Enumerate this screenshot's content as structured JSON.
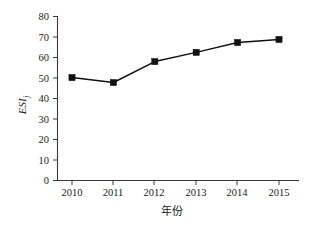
{
  "chart_data": {
    "type": "line",
    "title": "",
    "xlabel": "年份",
    "ylabel": "ESI",
    "ylabel_subscript": "j",
    "categories": [
      "2010",
      "2011",
      "2012",
      "2013",
      "2014",
      "2015"
    ],
    "x": [
      2010,
      2011,
      2012,
      2013,
      2014,
      2015
    ],
    "values": [
      50.2,
      47.8,
      58.0,
      62.5,
      67.3,
      68.8
    ],
    "series": [
      {
        "name": "ESIj",
        "values": [
          50.2,
          47.8,
          58.0,
          62.5,
          67.3,
          68.8
        ],
        "marker": "square",
        "color": "#111111"
      }
    ],
    "ylim": [
      0,
      80
    ],
    "yticks": [
      0,
      10,
      20,
      30,
      40,
      50,
      60,
      70,
      80
    ],
    "ytick_labels": [
      "0",
      "10",
      "20",
      "30",
      "40",
      "50",
      "60",
      "70",
      "80"
    ],
    "xtick_labels": [
      "2010",
      "2011",
      "2012",
      "2013",
      "2014",
      "2015"
    ],
    "grid": false,
    "legend": false,
    "legend_position": "none",
    "axes": {
      "left": true,
      "bottom": true,
      "top": false,
      "right": false,
      "tick_direction": "out"
    },
    "colors": {
      "line": "#111111",
      "marker": "#111111",
      "axis": "#3a3a3a",
      "text": "#1a1a1a",
      "background": "#ffffff"
    }
  }
}
